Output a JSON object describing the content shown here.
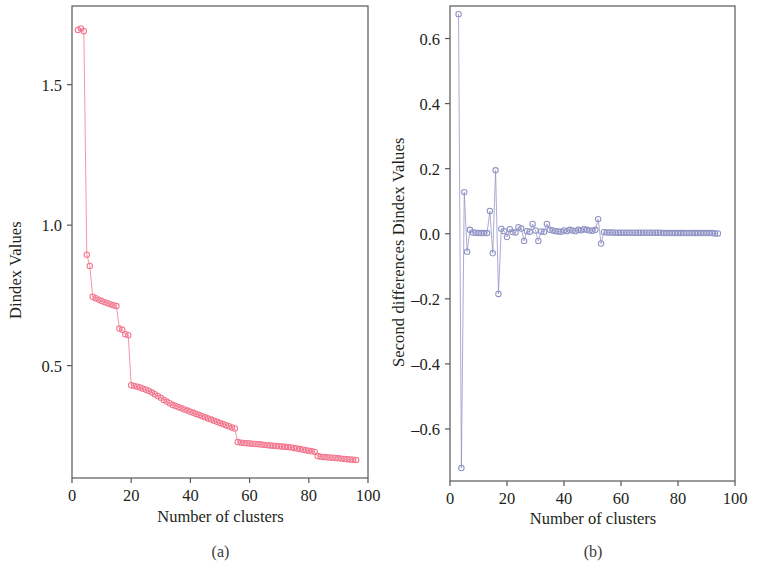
{
  "figure": {
    "background": "#ffffff",
    "panels": [
      {
        "id": "a",
        "caption": "(a)",
        "series_color": "#f2748c",
        "chart": {
          "type": "line",
          "title": "",
          "xlabel": "Number of clusters",
          "ylabel": "Dindex Values",
          "xlim": [
            0,
            100
          ],
          "ylim": [
            0.1,
            1.78
          ],
          "xticks": [
            0,
            20,
            40,
            60,
            80,
            100
          ],
          "xtick_labels": [
            "0",
            "20",
            "40",
            "60",
            "80",
            "100"
          ],
          "yticks": [
            0.5,
            1.0,
            1.5
          ],
          "ytick_labels": [
            "0.5",
            "1.0",
            "1.5"
          ],
          "grid": false,
          "legend": "none",
          "marker": "open-circle",
          "x": [
            2,
            3,
            4,
            5,
            6,
            7,
            8,
            9,
            10,
            11,
            12,
            13,
            14,
            15,
            16,
            17,
            18,
            19,
            20,
            21,
            22,
            23,
            24,
            25,
            26,
            27,
            28,
            29,
            30,
            31,
            32,
            33,
            34,
            35,
            36,
            37,
            38,
            39,
            40,
            41,
            42,
            43,
            44,
            45,
            46,
            47,
            48,
            49,
            50,
            51,
            52,
            53,
            54,
            55,
            56,
            57,
            58,
            59,
            60,
            61,
            62,
            63,
            64,
            65,
            66,
            67,
            68,
            69,
            70,
            71,
            72,
            73,
            74,
            75,
            76,
            77,
            78,
            79,
            80,
            81,
            82,
            83,
            84,
            85,
            86,
            87,
            88,
            89,
            90,
            91,
            92,
            93,
            94,
            95,
            96
          ],
          "y": [
            1.695,
            1.7,
            1.69,
            0.895,
            0.855,
            0.745,
            0.74,
            0.735,
            0.73,
            0.726,
            0.722,
            0.718,
            0.715,
            0.712,
            0.632,
            0.628,
            0.612,
            0.608,
            0.43,
            0.428,
            0.425,
            0.422,
            0.418,
            0.414,
            0.41,
            0.404,
            0.398,
            0.392,
            0.386,
            0.378,
            0.372,
            0.366,
            0.36,
            0.356,
            0.352,
            0.348,
            0.344,
            0.34,
            0.336,
            0.332,
            0.328,
            0.324,
            0.32,
            0.316,
            0.312,
            0.308,
            0.304,
            0.3,
            0.296,
            0.292,
            0.288,
            0.284,
            0.28,
            0.276,
            0.228,
            0.226,
            0.225,
            0.224,
            0.223,
            0.222,
            0.221,
            0.22,
            0.219,
            0.218,
            0.217,
            0.216,
            0.215,
            0.214,
            0.213,
            0.212,
            0.211,
            0.21,
            0.209,
            0.207,
            0.205,
            0.203,
            0.201,
            0.199,
            0.197,
            0.195,
            0.193,
            0.178,
            0.176,
            0.175,
            0.174,
            0.173,
            0.172,
            0.171,
            0.17,
            0.169,
            0.168,
            0.167,
            0.166,
            0.165,
            0.164
          ]
        }
      },
      {
        "id": "b",
        "caption": "(b)",
        "series_color": "#8f92c4",
        "chart": {
          "type": "line",
          "title": "",
          "xlabel": "Number of clusters",
          "ylabel": "Second differences Dindex Values",
          "xlim": [
            0,
            100
          ],
          "ylim": [
            -0.76,
            0.7
          ],
          "xticks": [
            0,
            20,
            40,
            60,
            80,
            100
          ],
          "xtick_labels": [
            "0",
            "20",
            "40",
            "60",
            "80",
            "100"
          ],
          "yticks": [
            -0.6,
            -0.4,
            -0.2,
            0.0,
            0.2,
            0.4,
            0.6
          ],
          "ytick_labels": [
            "–0.6",
            "–0.4",
            "–0.2",
            "0.0",
            "0.2",
            "0.4",
            "0.6"
          ],
          "grid": false,
          "legend": "none",
          "marker": "open-circle",
          "x": [
            3,
            4,
            5,
            6,
            7,
            8,
            9,
            10,
            11,
            12,
            13,
            14,
            15,
            16,
            17,
            18,
            19,
            20,
            21,
            22,
            23,
            24,
            25,
            26,
            27,
            28,
            29,
            30,
            31,
            32,
            33,
            34,
            35,
            36,
            37,
            38,
            39,
            40,
            41,
            42,
            43,
            44,
            45,
            46,
            47,
            48,
            49,
            50,
            51,
            52,
            53,
            54,
            55,
            56,
            57,
            58,
            59,
            60,
            61,
            62,
            63,
            64,
            65,
            66,
            67,
            68,
            69,
            70,
            71,
            72,
            73,
            74,
            75,
            76,
            77,
            78,
            79,
            80,
            81,
            82,
            83,
            84,
            85,
            86,
            87,
            88,
            89,
            90,
            91,
            92,
            93,
            94,
            95
          ],
          "y": [
            0.675,
            -0.72,
            0.128,
            -0.055,
            0.012,
            0.004,
            0.003,
            0.002,
            0.002,
            0.002,
            0.002,
            0.07,
            -0.06,
            0.195,
            -0.185,
            0.015,
            0.008,
            -0.01,
            0.014,
            0.005,
            0.004,
            0.02,
            0.016,
            -0.022,
            0.008,
            0.006,
            0.03,
            0.01,
            -0.022,
            0.007,
            0.006,
            0.03,
            0.012,
            0.01,
            0.008,
            0.007,
            0.006,
            0.01,
            0.008,
            0.012,
            0.01,
            0.008,
            0.012,
            0.011,
            0.014,
            0.012,
            0.01,
            0.009,
            0.012,
            0.045,
            -0.03,
            0.005,
            0.004,
            0.004,
            0.004,
            0.003,
            0.003,
            0.003,
            0.003,
            0.003,
            0.003,
            0.003,
            0.003,
            0.003,
            0.003,
            0.003,
            0.003,
            0.003,
            0.003,
            0.003,
            0.003,
            0.003,
            0.002,
            0.002,
            0.002,
            0.002,
            0.002,
            0.002,
            0.002,
            0.002,
            0.002,
            0.002,
            0.002,
            0.002,
            0.002,
            0.002,
            0.002,
            0.002,
            0.002,
            0.002,
            0.001,
            0.001
          ]
        }
      }
    ]
  }
}
